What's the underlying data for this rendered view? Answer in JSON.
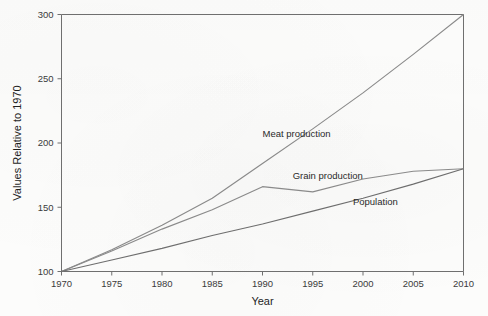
{
  "chart_data": {
    "type": "line",
    "title": "",
    "xlabel": "Year",
    "ylabel": "Values Relative to 1970",
    "xlim": [
      1970,
      2010
    ],
    "ylim": [
      100,
      300
    ],
    "grid": false,
    "legend_position": "inline-labels",
    "x_ticks": [
      1970,
      1975,
      1980,
      1985,
      1990,
      1995,
      2000,
      2005,
      2010
    ],
    "y_ticks": [
      100,
      150,
      200,
      250,
      300
    ],
    "x": [
      1970,
      1975,
      1980,
      1985,
      1990,
      1995,
      2000,
      2005,
      2010
    ],
    "series": [
      {
        "name": "Meat production",
        "color": "#8a8a8a",
        "values": [
          100,
          117,
          136,
          157,
          184,
          211,
          239,
          269,
          300
        ],
        "label_x": 1990,
        "label_y": 205
      },
      {
        "name": "Grain production",
        "color": "#8a8a8a",
        "values": [
          100,
          116,
          133,
          148,
          166,
          162,
          172,
          178,
          180
        ],
        "label_x": 1993,
        "label_y": 172
      },
      {
        "name": "Population",
        "color": "#6e6e6e",
        "values": [
          100,
          109,
          118,
          128,
          137,
          147,
          157,
          168,
          180
        ],
        "label_x": 1999,
        "label_y": 152
      }
    ]
  },
  "axis": {
    "x_tick_labels": [
      "1970",
      "1975",
      "1980",
      "1985",
      "1990",
      "1995",
      "2000",
      "2005",
      "2010"
    ],
    "y_tick_labels": [
      "100",
      "150",
      "200",
      "250",
      "300"
    ],
    "x_title": "Year",
    "y_title": "Values Relative to 1970"
  },
  "series_labels": {
    "meat": "Meat production",
    "grain": "Grain production",
    "population": "Population"
  },
  "colors": {
    "background": "#fcfcfb",
    "axis": "#6f6f6f",
    "line_light": "#8a8a8a",
    "line_dark": "#6e6e6e",
    "text": "#1f1f1f"
  }
}
